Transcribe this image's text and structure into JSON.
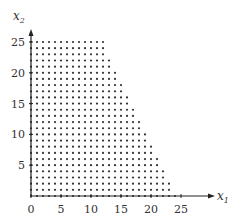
{
  "chart_data": {
    "type": "scatter",
    "title": "",
    "xlabel": "x1",
    "ylabel": "x2",
    "xlabel_main": "x",
    "xlabel_sub": "1",
    "ylabel_main": "x",
    "ylabel_sub": "2",
    "xlim": [
      0,
      29
    ],
    "ylim": [
      0,
      27
    ],
    "x_ticks": [
      0,
      5,
      10,
      15,
      20,
      25
    ],
    "y_ticks": [
      5,
      10,
      15,
      20,
      25
    ],
    "grid": false,
    "legend": null,
    "region": {
      "constraints": [
        "x1 >= 0",
        "x2 >= 0",
        "x2 <= 25",
        "25*x1 + 12*x2 <= 600"
      ],
      "vertices": [
        [
          0,
          0
        ],
        [
          24,
          0
        ],
        [
          12,
          25
        ],
        [
          0,
          25
        ]
      ]
    },
    "points_rule": "all integer (x1, x2) with 0<=x2<=25 and 0<=x1<=floor((600-12*x2)/25)",
    "colors": {
      "point": "#333333",
      "axis": "#222222"
    }
  }
}
